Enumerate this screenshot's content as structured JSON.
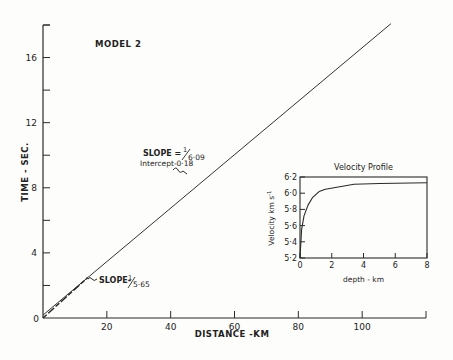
{
  "chart_data": [
    {
      "type": "line",
      "title": "MODEL 2",
      "xlabel": "DISTANCE - KM",
      "ylabel": "TIME - SEC.",
      "xlim": [
        0,
        120
      ],
      "ylim": [
        0,
        18
      ],
      "x_ticks": [
        0,
        20,
        40,
        60,
        80,
        100,
        120
      ],
      "x_tick_labels": [
        "0",
        "20",
        "40",
        "60",
        "80",
        "100",
        ""
      ],
      "y_ticks": [
        0,
        2,
        4,
        6,
        8,
        10,
        12,
        14,
        16,
        18
      ],
      "y_tick_labels": [
        "0",
        "",
        "4",
        "",
        "8",
        "",
        "12",
        "",
        "16",
        ""
      ],
      "grid": false,
      "series": [
        {
          "name": "travel-time line (far)",
          "slope_label": "SLOPE = 1/6.09",
          "intercept_label": "Intercept-0.18",
          "x": [
            0,
            109
          ],
          "y": [
            0.18,
            18.08
          ]
        },
        {
          "name": "travel-time line (near, dashed)",
          "slope_label": "SLOPE-1/5.65",
          "x": [
            0,
            14
          ],
          "y": [
            0,
            2.48
          ]
        }
      ],
      "annotations": [
        {
          "text": "SLOPE = 1/6.09",
          "x": 42,
          "y": 10.2
        },
        {
          "text": "Intercept-0.18",
          "x": 42,
          "y": 9.3
        },
        {
          "text": "SLOPE-1/5.65",
          "x": 16,
          "y": 2.0
        }
      ]
    },
    {
      "type": "line",
      "title": "Velocity Profile",
      "xlabel": "depth - km",
      "ylabel": "Velocity km s-1",
      "xlim": [
        0,
        8
      ],
      "ylim": [
        5.2,
        6.2
      ],
      "x_ticks": [
        0,
        2,
        4,
        6,
        8
      ],
      "y_ticks": [
        5.2,
        5.4,
        5.6,
        5.8,
        6.0,
        6.2
      ],
      "y_tick_labels": [
        "5·2",
        "5·4",
        "5·6",
        "5·8",
        "6·0",
        "6·2"
      ],
      "series": [
        {
          "name": "velocity",
          "x": [
            0,
            0.1,
            0.25,
            0.5,
            0.8,
            1.2,
            1.6,
            2.5,
            3.4,
            5,
            8
          ],
          "y": [
            5.2,
            5.55,
            5.72,
            5.85,
            5.95,
            6.02,
            6.05,
            6.08,
            6.11,
            6.12,
            6.13
          ]
        }
      ]
    }
  ],
  "labels": {
    "model": "MODEL 2",
    "ylabel": "TIME - SEC.",
    "xlabel": "DISTANCE -KM",
    "slope1a": "SLOPE = ",
    "slope1b": "6·09",
    "intercept": "Intercept-0·18",
    "slope2a": "SLOPE-",
    "slope2b": "5·65",
    "inset_title": "Velocity Profile",
    "inset_xlabel": "depth - km",
    "inset_ylabel": "Velocity km s",
    "inset_ylabel_sup": "-1"
  }
}
